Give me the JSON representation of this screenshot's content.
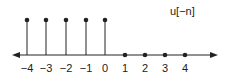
{
  "title": "u[−n]",
  "colors": {
    "stroke": "#222222",
    "background": "#ffffff"
  },
  "axis": {
    "y": 55,
    "x_start": 12,
    "x_end": 218,
    "arrows": "both"
  },
  "chart_data": {
    "type": "stem",
    "title": "u[−n]",
    "xlabel": "",
    "ylabel": "",
    "x": [
      -4,
      -3,
      -2,
      -1,
      0,
      1,
      2,
      3,
      4
    ],
    "values": [
      1,
      1,
      1,
      1,
      1,
      0,
      0,
      0,
      0
    ],
    "tick_labels": [
      "−4",
      "−3",
      "−2",
      "−1",
      "0",
      "1",
      "2",
      "3",
      "4"
    ],
    "grid": false,
    "legend": null
  },
  "points": [
    {
      "n": -4,
      "label": "−4",
      "x": 27,
      "value": 1
    },
    {
      "n": -3,
      "label": "−3",
      "x": 46,
      "value": 1
    },
    {
      "n": -2,
      "label": "−2",
      "x": 66,
      "value": 1
    },
    {
      "n": -1,
      "label": "−1",
      "x": 86,
      "value": 1
    },
    {
      "n": 0,
      "label": "0",
      "x": 105,
      "value": 1
    },
    {
      "n": 1,
      "label": "1",
      "x": 125,
      "value": 0
    },
    {
      "n": 2,
      "label": "2",
      "x": 145,
      "value": 0
    },
    {
      "n": 3,
      "label": "3",
      "x": 165,
      "value": 0
    },
    {
      "n": 4,
      "label": "4",
      "x": 185,
      "value": 0
    }
  ],
  "stem_top_y": 20,
  "label_y": 72
}
